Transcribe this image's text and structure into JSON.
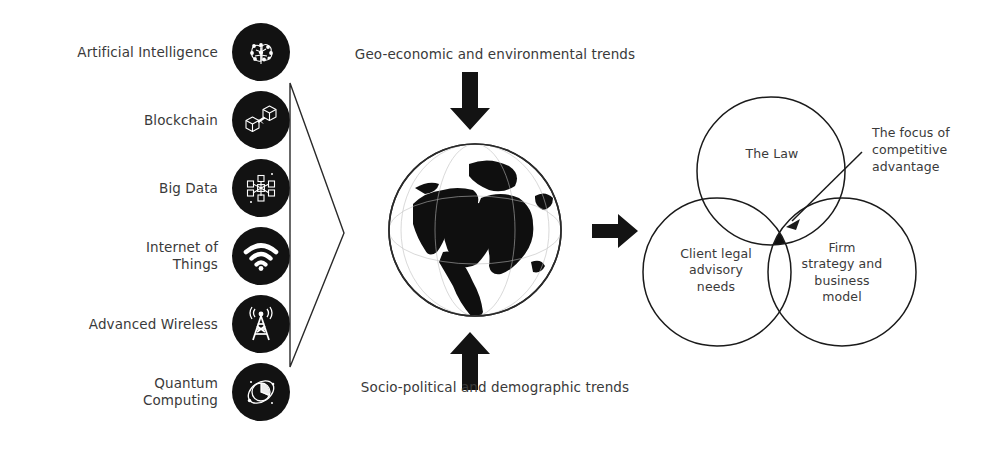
{
  "diagram": {
    "colors": {
      "badge_fill": "#121212",
      "text": "#3a3a3a",
      "line": "#1a1a1a",
      "intersection_fill": "#111111",
      "background": "#ffffff"
    }
  },
  "tech_list": {
    "items": [
      {
        "label": "Artificial Intelligence",
        "icon": "brain-network-icon"
      },
      {
        "label": "Blockchain",
        "icon": "linked-cubes-icon"
      },
      {
        "label": "Big Data",
        "icon": "node-network-icon"
      },
      {
        "label": "Internet of\nThings",
        "icon": "wifi-signal-icon"
      },
      {
        "label": "Advanced Wireless",
        "icon": "radio-tower-icon"
      },
      {
        "label": "Quantum\nComputing",
        "icon": "atom-orbit-icon"
      }
    ]
  },
  "middle": {
    "bracket_icon": "triangle-bracket-icon",
    "top_trend_label": "Geo-economic and environmental trends",
    "bottom_trend_label": "Socio-political and demographic trends",
    "globe_icon": "globe-icon",
    "arrow_down_icon": "arrow-down-icon",
    "arrow_up_icon": "arrow-up-icon",
    "arrow_right_icon": "arrow-right-icon"
  },
  "venn": {
    "circles": [
      {
        "id": "law",
        "label": "The Law",
        "cx": 171,
        "cy": 111,
        "r": 74
      },
      {
        "id": "client",
        "label": "Client legal\nadvisory\nneeds",
        "cx": 117,
        "cy": 212,
        "r": 74
      },
      {
        "id": "firm",
        "label": "Firm\nstrategy and\nbusiness\nmodel",
        "cx": 242,
        "cy": 212,
        "r": 74
      }
    ],
    "intersection": {
      "label": "The focus of\ncompetitive\nadvantage",
      "callout_icon": "callout-arrow-icon"
    }
  }
}
